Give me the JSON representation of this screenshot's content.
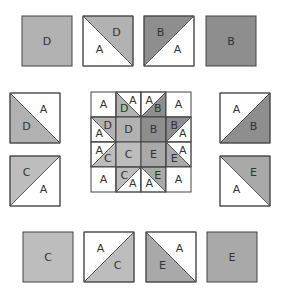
{
  "colors": {
    "A": "#ffffff",
    "B": "#8e8e8e",
    "C": "#bdbdbd",
    "D": "#b2b2b2",
    "E": "#a9a9a9",
    "stroke": "#444444"
  },
  "top_row": [
    {
      "type": "solid",
      "fill": "D",
      "label": "D"
    },
    {
      "type": "hst",
      "diag": "tlbr",
      "upper": "D",
      "lower": "A",
      "upper_label": "D",
      "lower_label": "A"
    },
    {
      "type": "hst",
      "diag": "trbl",
      "upper": "B",
      "lower": "A",
      "upper_label": "B",
      "lower_label": "A"
    },
    {
      "type": "solid",
      "fill": "B",
      "label": "B"
    }
  ],
  "left_col": [
    {
      "type": "hst",
      "diag": "tlbr",
      "upper": "A",
      "lower": "D",
      "upper_label": "A",
      "lower_label": "D"
    },
    {
      "type": "hst",
      "diag": "trbl",
      "upper": "C",
      "lower": "A",
      "upper_label": "C",
      "lower_label": "A"
    }
  ],
  "right_col": [
    {
      "type": "hst",
      "diag": "trbl",
      "upper": "A",
      "lower": "B",
      "upper_label": "A",
      "lower_label": "B"
    },
    {
      "type": "hst",
      "diag": "tlbr",
      "upper": "E",
      "lower": "A",
      "upper_label": "E",
      "lower_label": "A"
    }
  ],
  "bottom_row": [
    {
      "type": "solid",
      "fill": "C",
      "label": "C"
    },
    {
      "type": "hst",
      "diag": "trbl",
      "upper": "A",
      "lower": "C",
      "upper_label": "A",
      "lower_label": "C"
    },
    {
      "type": "hst",
      "diag": "tlbr",
      "upper": "A",
      "lower": "E",
      "upper_label": "A",
      "lower_label": "E"
    },
    {
      "type": "solid",
      "fill": "E",
      "label": "E"
    }
  ],
  "center_block": [
    [
      {
        "type": "solid",
        "fill": "A",
        "label": "A"
      },
      {
        "type": "hst",
        "diag": "tlbr",
        "upper": "A",
        "lower": "D",
        "upper_label": "A",
        "lower_label": "D"
      },
      {
        "type": "hst",
        "diag": "trbl",
        "upper": "A",
        "lower": "B",
        "upper_label": "A",
        "lower_label": "B"
      },
      {
        "type": "solid",
        "fill": "A",
        "label": "A"
      }
    ],
    [
      {
        "type": "hst",
        "diag": "tlbr",
        "upper": "D",
        "lower": "A",
        "upper_label": "D",
        "lower_label": "A"
      },
      {
        "type": "solid",
        "fill": "D",
        "label": "D"
      },
      {
        "type": "solid",
        "fill": "B",
        "label": "B"
      },
      {
        "type": "hst",
        "diag": "trbl",
        "upper": "B",
        "lower": "A",
        "upper_label": "B",
        "lower_label": "A"
      }
    ],
    [
      {
        "type": "hst",
        "diag": "trbl",
        "upper": "A",
        "lower": "C",
        "upper_label": "A",
        "lower_label": "C"
      },
      {
        "type": "solid",
        "fill": "C",
        "label": "C"
      },
      {
        "type": "solid",
        "fill": "E",
        "label": "E"
      },
      {
        "type": "hst",
        "diag": "tlbr",
        "upper": "A",
        "lower": "E",
        "upper_label": "A",
        "lower_label": "E"
      }
    ],
    [
      {
        "type": "solid",
        "fill": "A",
        "label": "A"
      },
      {
        "type": "hst",
        "diag": "trbl",
        "upper": "C",
        "lower": "A",
        "upper_label": "C",
        "lower_label": "A"
      },
      {
        "type": "hst",
        "diag": "tlbr",
        "upper": "E",
        "lower": "A",
        "upper_label": "E",
        "lower_label": "A"
      },
      {
        "type": "solid",
        "fill": "A",
        "label": "A"
      }
    ]
  ]
}
